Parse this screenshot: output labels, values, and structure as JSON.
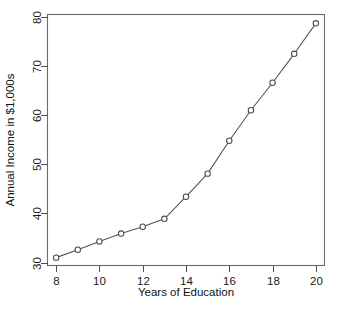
{
  "chart_data": {
    "type": "line",
    "title": "",
    "xlabel": "Years of Education",
    "ylabel": "Annual Income in $1,000s",
    "x": [
      8,
      9,
      10,
      11,
      12,
      13,
      14,
      15,
      16,
      17,
      18,
      19,
      20
    ],
    "values": [
      31.0,
      32.6,
      34.3,
      35.9,
      37.3,
      38.9,
      43.4,
      48.1,
      54.8,
      61.0,
      66.6,
      72.5,
      78.7
    ],
    "series": [
      {
        "name": "Annual Income",
        "values": [
          31.0,
          32.6,
          34.3,
          35.9,
          37.3,
          38.9,
          43.4,
          48.1,
          54.8,
          61.0,
          66.6,
          72.5,
          78.7
        ]
      }
    ],
    "xlim": [
      7.6,
      20.4
    ],
    "ylim": [
      29.4,
      80.5
    ],
    "xticks": [
      8,
      10,
      12,
      14,
      16,
      18,
      20
    ],
    "yticks": [
      30,
      40,
      50,
      60,
      70,
      80
    ],
    "xtick_labels": [
      "8",
      "10",
      "12",
      "14",
      "16",
      "18",
      "20"
    ],
    "ytick_labels": [
      "30",
      "40",
      "50",
      "60",
      "70",
      "80"
    ],
    "grid": false,
    "legend": false,
    "legend_position": "none",
    "marker": "open-circle",
    "line_color": "#555555",
    "marker_fill": "#ffffff",
    "marker_stroke": "#4a4a4a",
    "frame_color": "#6b6b6b",
    "background": "#ffffff",
    "annotations": []
  },
  "figure": {
    "top_cropped_text": "",
    "axis_titles": {
      "x": "Years of Education",
      "y": "Annual Income in $1,000s"
    }
  }
}
